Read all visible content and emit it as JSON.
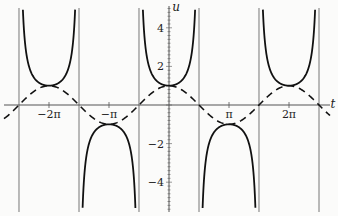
{
  "chart_data": {
    "type": "line",
    "title": "",
    "xlabel": "t",
    "ylabel": "u",
    "xlim": [
      -8.9,
      8.5
    ],
    "ylim": [
      -5.6,
      5.4
    ],
    "x_ticks": [
      {
        "value": -6.2832,
        "label": "−2π"
      },
      {
        "value": -3.1416,
        "label": "−π"
      },
      {
        "value": 3.1416,
        "label": "π"
      },
      {
        "value": 6.2832,
        "label": "2π"
      }
    ],
    "y_ticks": [
      {
        "value": 4,
        "label": "4"
      },
      {
        "value": 2,
        "label": "2"
      },
      {
        "value": -2,
        "label": "−2"
      },
      {
        "value": -4,
        "label": "−4"
      }
    ],
    "grid": false,
    "vertical_asymptotes": [
      -7.854,
      -4.712,
      -1.5708,
      1.5708,
      4.712,
      7.854
    ],
    "series": [
      {
        "name": "u = sec t",
        "style": "solid",
        "function": "1/cos(t)"
      },
      {
        "name": "u = cos t",
        "style": "dashed",
        "function": "cos(t)"
      }
    ]
  },
  "axes": {
    "x_label": "t",
    "y_label": "u"
  }
}
